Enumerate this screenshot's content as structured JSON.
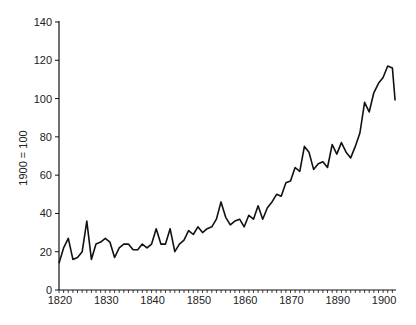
{
  "chart_data": {
    "type": "line",
    "title": "",
    "xlabel": "",
    "ylabel": "1900 = 100",
    "ylim": [
      0,
      140
    ],
    "y_ticks": [
      0,
      20,
      40,
      60,
      80,
      100,
      120,
      140
    ],
    "x_tick_labels": [
      "1820",
      "1830",
      "1840",
      "1850",
      "1860",
      "1870",
      "1890",
      "1900"
    ],
    "grid": false,
    "legend": null,
    "series": [
      {
        "name": "Index",
        "color": "#111111",
        "x": [
          1820,
          1821,
          1822,
          1823,
          1824,
          1825,
          1826,
          1827,
          1828,
          1829,
          1830,
          1831,
          1832,
          1833,
          1834,
          1835,
          1836,
          1837,
          1838,
          1839,
          1840,
          1841,
          1842,
          1843,
          1844,
          1845,
          1846,
          1847,
          1848,
          1849,
          1850,
          1851,
          1852,
          1853,
          1854,
          1855,
          1856,
          1857,
          1858,
          1859,
          1860,
          1861,
          1862,
          1863,
          1864,
          1865,
          1866,
          1867,
          1868,
          1869,
          1870,
          1871,
          1872,
          1873,
          1874,
          1875,
          1876,
          1877,
          1878,
          1879,
          1880,
          1881,
          1882,
          1883,
          1884,
          1885,
          1886,
          1887,
          1888,
          1889,
          1890,
          1891,
          1892,
          1892.6
        ],
        "values": [
          14,
          22,
          27,
          16,
          17,
          20,
          36,
          16,
          24,
          25,
          27,
          25,
          17,
          22,
          24,
          24,
          21,
          21,
          24,
          22,
          24,
          32,
          24,
          24,
          32,
          20,
          24,
          26,
          31,
          29,
          33,
          30,
          32,
          33,
          37,
          46,
          38,
          34,
          36,
          37,
          33,
          39,
          37,
          44,
          37,
          43,
          46,
          50,
          49,
          56,
          57,
          64,
          62,
          75,
          72,
          63,
          66,
          67,
          64,
          76,
          71,
          77,
          72,
          69,
          75,
          82,
          98,
          93,
          103,
          108,
          111,
          117,
          116,
          99
        ]
      }
    ]
  }
}
